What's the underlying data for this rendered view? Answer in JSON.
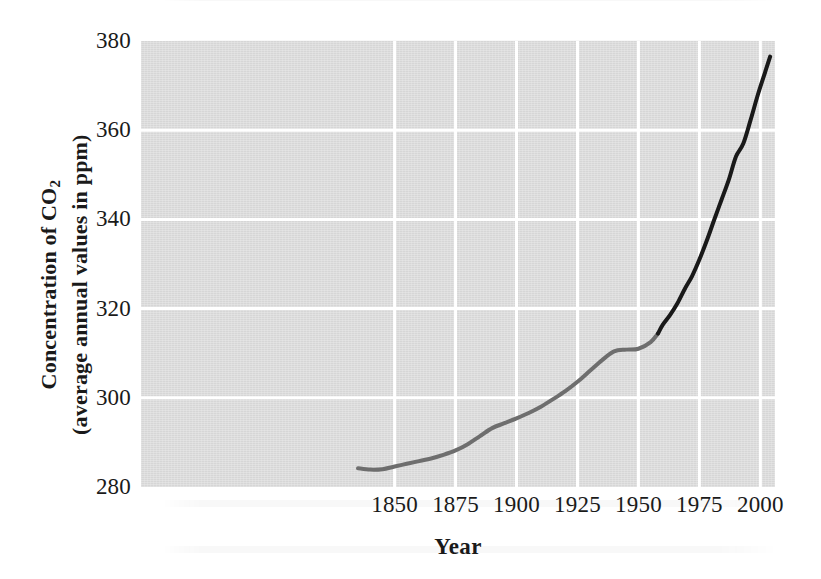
{
  "figure": {
    "background_color": "#ffffff",
    "plot_background_color": "#dcdcdc",
    "gridline_color": "#ffffff"
  },
  "chart_data": {
    "type": "line",
    "title": "",
    "subtitle": "",
    "xlabel": "Year",
    "ylabel_line1": "Concentration of CO",
    "ylabel_sub": "2",
    "ylabel_line2": "(average annual values in ppm)",
    "xlim": [
      1746,
      2006
    ],
    "ylim": [
      280,
      380
    ],
    "xticks": [
      1850,
      1875,
      1900,
      1925,
      1950,
      1975,
      2000
    ],
    "xtick_labels": [
      "1850",
      "1875",
      "1900",
      "1925",
      "1950",
      "1975",
      "2000"
    ],
    "yticks": [
      280,
      300,
      320,
      340,
      360,
      380
    ],
    "ytick_labels": [
      "280",
      "300",
      "320",
      "340",
      "360",
      "380"
    ],
    "grid": true,
    "grid_axis": "both",
    "legend": "none",
    "annotations": [],
    "series": [
      {
        "name": "Ice-core record",
        "color": "#6e6e6e",
        "line_width": 4,
        "x": [
          1835,
          1840,
          1845,
          1850,
          1855,
          1860,
          1865,
          1870,
          1875,
          1880,
          1885,
          1890,
          1895,
          1900,
          1905,
          1910,
          1915,
          1920,
          1925,
          1930,
          1935,
          1940,
          1945,
          1950,
          1955,
          1958
        ],
        "y": [
          284.2,
          283.9,
          284.0,
          284.6,
          285.2,
          285.8,
          286.4,
          287.2,
          288.2,
          289.6,
          291.4,
          293.2,
          294.3,
          295.4,
          296.6,
          298.0,
          299.7,
          301.5,
          303.6,
          306.0,
          308.4,
          310.4,
          310.8,
          311.0,
          312.5,
          314.4
        ]
      },
      {
        "name": "Mauna Loa record",
        "color": "#191919",
        "line_width": 4,
        "x": [
          1958,
          1960,
          1963,
          1966,
          1969,
          1972,
          1975,
          1978,
          1981,
          1984,
          1987,
          1990,
          1993,
          1996,
          1999,
          2002,
          2004
        ],
        "y": [
          314.4,
          316.4,
          318.6,
          321.2,
          324.4,
          327.3,
          331.0,
          335.2,
          339.8,
          344.3,
          348.8,
          354.1,
          357.0,
          362.3,
          368.0,
          373.1,
          376.5
        ]
      }
    ]
  }
}
